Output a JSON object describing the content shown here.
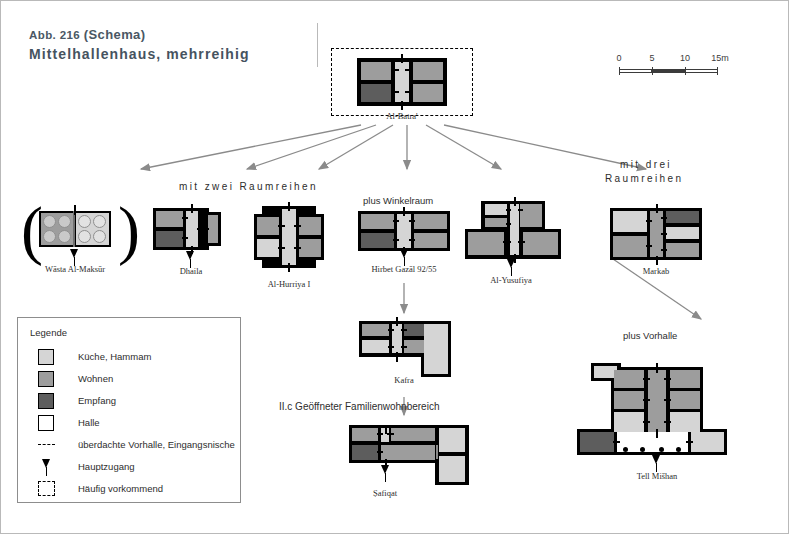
{
  "figure": {
    "number": "Abb. 216",
    "schema_word": "(Schema)",
    "title": "Mittelhallenhaus, mehrreihig"
  },
  "scale": {
    "ticks": [
      "0",
      "5",
      "10",
      "15m"
    ],
    "unit_label": "15m"
  },
  "legend": {
    "title": "Legende",
    "items": [
      {
        "label": "Küche, Hammam",
        "color": "#d5d5d5",
        "type": "swatch"
      },
      {
        "label": "Wohnen",
        "color": "#9d9d9d",
        "type": "swatch"
      },
      {
        "label": "Empfang",
        "color": "#5d5d5d",
        "type": "swatch"
      },
      {
        "label": "Halle",
        "color": "#ffffff",
        "type": "swatch"
      },
      {
        "label": "überdachte Vorhalle, Eingangsnische",
        "type": "dashed-line"
      },
      {
        "label": "Hauptzugang",
        "type": "arrow"
      },
      {
        "label": "Häufig vorkommend",
        "type": "dashed-frame"
      }
    ]
  },
  "group_labels": {
    "two_rows": "mit  zwei  Raumreihen",
    "three_rows_line1": "mit  drei",
    "three_rows_line2": "Raumreihen",
    "plus_winkelraum": "plus Winkelraum",
    "plus_vorhalle": "plus Vorhalle",
    "section_caption": "II.c Geöffneter Familienwohnbereich"
  },
  "plans": {
    "root": {
      "label": "Al-Batra'"
    },
    "wasta": {
      "label": "Wāsta Al-Maksūr"
    },
    "dhaila": {
      "label": "Dhaila"
    },
    "hurriya": {
      "label": "Al-Hurriya I"
    },
    "gazal": {
      "label": "Hirbet Gazāl 92/55"
    },
    "yusufiya": {
      "label": "Al-Yusufiya"
    },
    "markab": {
      "label": "Markab"
    },
    "kafra": {
      "label": "Kafra"
    },
    "safiqat": {
      "label": "Ṣafiqat"
    },
    "mishan": {
      "label": "Tell Mišhan"
    }
  },
  "colors": {
    "kueche": "#d5d5d5",
    "wohnen": "#9d9d9d",
    "empfang": "#5d5d5d",
    "halle": "#ffffff",
    "wall": "#000000",
    "title": "#46535f",
    "arrow": "#8b8b8b"
  }
}
